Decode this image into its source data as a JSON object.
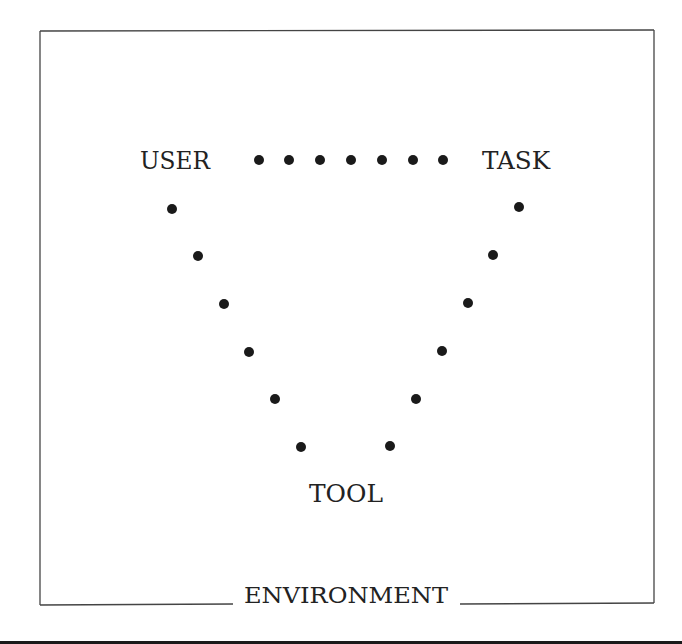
{
  "diagram": {
    "frame_label": "ENVIRONMENT",
    "nodes": {
      "user": "USER",
      "task": "TASK",
      "tool": "TOOL"
    },
    "edges": [
      {
        "from": "USER",
        "to": "TASK",
        "style": "dotted",
        "dots": [
          [
            259,
            160
          ],
          [
            289,
            160
          ],
          [
            320,
            160
          ],
          [
            351,
            160
          ],
          [
            382,
            160
          ],
          [
            413,
            160
          ],
          [
            443,
            160
          ]
        ]
      },
      {
        "from": "USER",
        "to": "TOOL",
        "style": "dotted",
        "dots": [
          [
            172,
            209
          ],
          [
            198,
            256
          ],
          [
            224,
            304
          ],
          [
            249,
            352
          ],
          [
            275,
            399
          ],
          [
            301,
            447
          ]
        ]
      },
      {
        "from": "TASK",
        "to": "TOOL",
        "style": "dotted",
        "dots": [
          [
            519,
            207
          ],
          [
            493,
            255
          ],
          [
            468,
            303
          ],
          [
            442,
            351
          ],
          [
            416,
            399
          ],
          [
            390,
            446
          ]
        ]
      }
    ],
    "colors": {
      "ink": "#222222",
      "frame": "#444444",
      "background": "#ffffff"
    }
  }
}
